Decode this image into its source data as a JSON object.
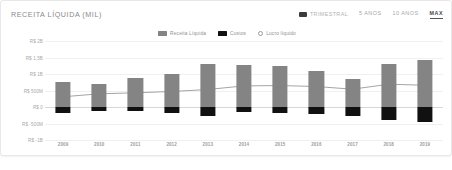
{
  "header": {
    "title": "RECEITA LÍQUIDA (MIL)",
    "frequency_label": "TRIMESTRAL",
    "range_buttons": [
      {
        "label": "5 ANOS",
        "active": false
      },
      {
        "label": "10 ANOS",
        "active": false
      },
      {
        "label": "MAX",
        "active": true
      }
    ]
  },
  "colors": {
    "revenue": "#848484",
    "cost": "#111111",
    "profit_line": "#9a9a9a",
    "grid": "#f0f0f0",
    "zero_line": "#d8d8d8",
    "title_text": "#8a8a8a",
    "active_button": "#4a4a4a"
  },
  "chart_data": {
    "type": "bar",
    "title": "RECEITA LÍQUIDA (MIL)",
    "xlabel": "",
    "ylabel": "",
    "grid": true,
    "legend_position": "top-center",
    "categories": [
      "2009",
      "2010",
      "2011",
      "2012",
      "2013",
      "2014",
      "2015",
      "2016",
      "2017",
      "2018",
      "2019"
    ],
    "ytick_labels": [
      "R$ 2B",
      "R$ 1,5B",
      "R$ 1B",
      "R$ 500M",
      "R$ 0",
      "R$ -500M",
      "R$ -1B"
    ],
    "ytick_values": [
      2000,
      1500,
      1000,
      500,
      0,
      -500,
      -1000
    ],
    "ylim": [
      -1000,
      2000
    ],
    "series": [
      {
        "name": "Receita Líquida",
        "type": "bar",
        "color": "#848484",
        "values": [
          760,
          700,
          880,
          1000,
          1300,
          1280,
          1240,
          1100,
          860,
          1310,
          1420
        ]
      },
      {
        "name": "Custos",
        "type": "bar",
        "color": "#111111",
        "values": [
          -170,
          -110,
          -120,
          -180,
          -260,
          -150,
          -190,
          -200,
          -280,
          -390,
          -460
        ]
      },
      {
        "name": "Lucro líquido",
        "type": "line",
        "color": "#9a9a9a",
        "values": [
          310,
          400,
          430,
          470,
          530,
          640,
          650,
          620,
          540,
          690,
          660
        ]
      }
    ],
    "legend": [
      {
        "label": "Receita Líquida",
        "marker": "square",
        "color": "#848484"
      },
      {
        "label": "Custos",
        "marker": "square",
        "color": "#111111"
      },
      {
        "label": "Lucro líquido",
        "marker": "circle",
        "color": "#9a9a9a"
      }
    ]
  }
}
